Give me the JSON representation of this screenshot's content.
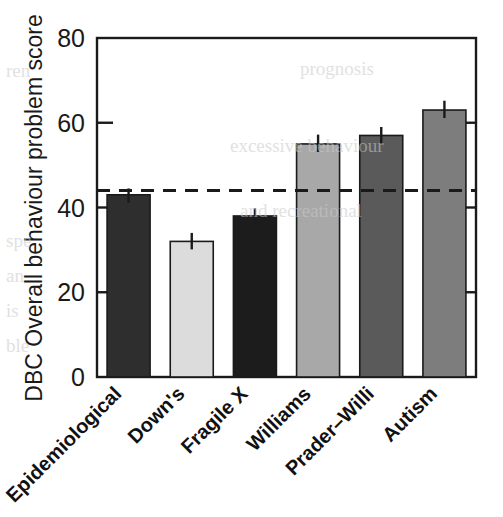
{
  "chart_data": {
    "type": "bar",
    "title": "",
    "subtitle": "",
    "xlabel": "",
    "ylabel": "DBC Overall behaviour problem score",
    "categories": [
      "Epidemiological",
      "Down's",
      "Fragile X",
      "Williams",
      "Prader–Willi",
      "Autism"
    ],
    "values": [
      43,
      32,
      38,
      55,
      57,
      63
    ],
    "errors": [
      1.5,
      2.0,
      1.8,
      2.2,
      2.0,
      2.2
    ],
    "bar_colors": [
      "#2e2e2e",
      "#dcdcdc",
      "#1c1c1c",
      "#a8a8a8",
      "#5a5a5a",
      "#7d7d7d"
    ],
    "ylim": [
      0,
      80
    ],
    "yticks": [
      0,
      20,
      40,
      60,
      80
    ],
    "ytick_labels": [
      "0",
      "20",
      "40",
      "60",
      "80"
    ],
    "grid": false,
    "legend": "none",
    "reference_line": {
      "value": 44,
      "style": "dashed",
      "color": "#1a1a1a",
      "label": ""
    },
    "axis_color": "#1a1a1a",
    "background": "#ffffff"
  },
  "background_page_text": [
    "prognosis",
    "excessive behaviour",
    "and recreational",
    "ren",
    "spe",
    "an",
    "is",
    "ble"
  ]
}
